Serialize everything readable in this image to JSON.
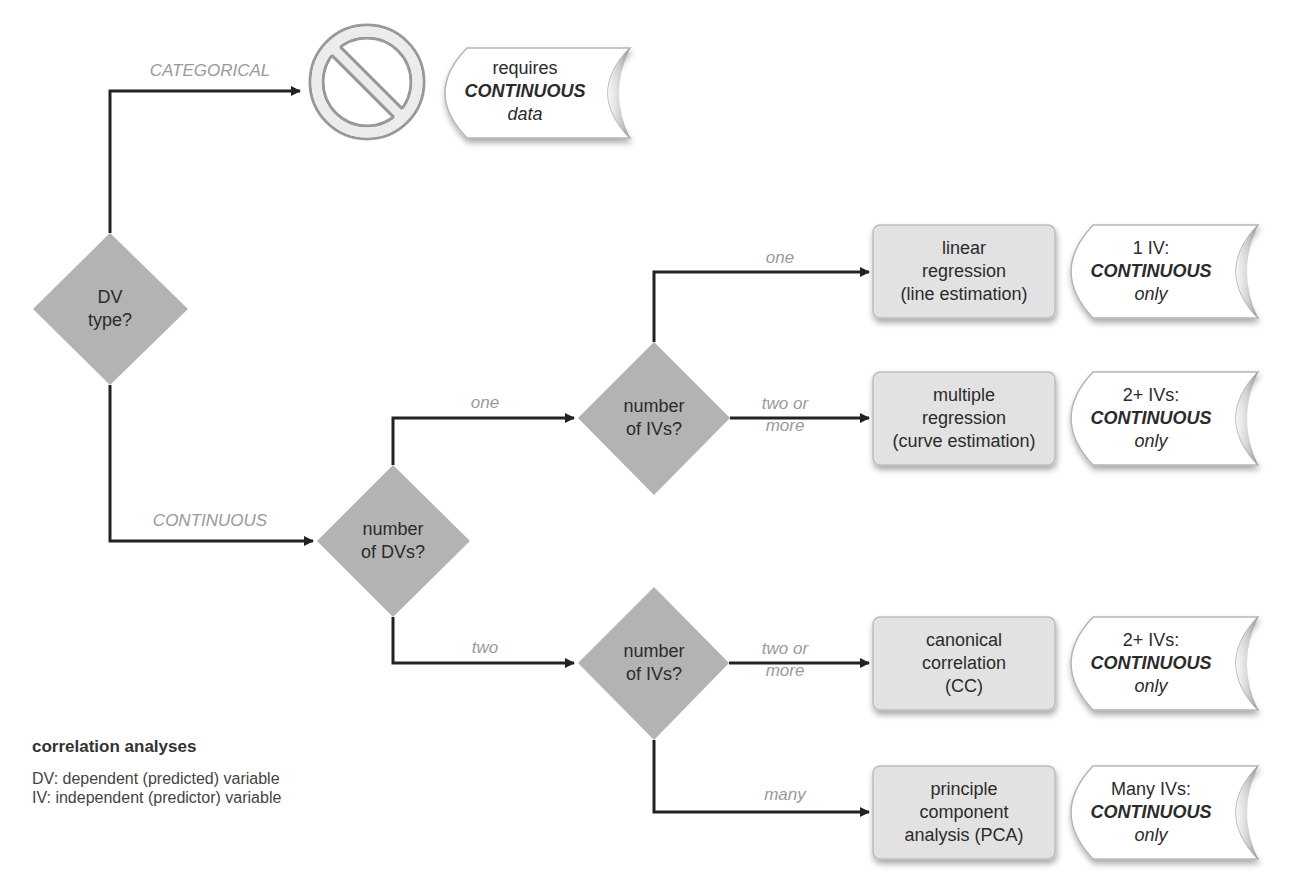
{
  "title": "correlation analyses",
  "legend": {
    "title": "correlation analyses",
    "lines": [
      "DV: dependent (predicted) variable",
      "IV: independent (predictor) variable"
    ]
  },
  "colors": {
    "diamond_fill": "#b3b3b3",
    "box_fill": "#e2e2e2",
    "box_border": "#bdbdbd",
    "arrow": "#222222",
    "branch_label": "#9a9a9a",
    "prohibit_stroke": "#999999"
  },
  "decisions": {
    "dv_type": {
      "lines": [
        "DV",
        "type?"
      ]
    },
    "num_dvs": {
      "lines": [
        "number",
        "of DVs?"
      ]
    },
    "num_ivs_one": {
      "lines": [
        "number",
        "of IVs?"
      ]
    },
    "num_ivs_two": {
      "lines": [
        "number",
        "of IVs?"
      ]
    }
  },
  "branches": {
    "categorical": "CATEGORICAL",
    "continuous": "CONTINUOUS",
    "dvs_one": "one",
    "dvs_two": "two",
    "ivs_one": "one",
    "ivs_two_or_more_a": [
      "two or",
      "more"
    ],
    "ivs_two_or_more_b": [
      "two or",
      "more"
    ],
    "ivs_many": "many"
  },
  "blocked": {
    "icon": "prohibited-icon",
    "note": {
      "line1": "requires",
      "line2": "CONTINUOUS",
      "line3": "data"
    }
  },
  "outcomes": [
    {
      "id": "linear-regression",
      "lines": [
        "linear",
        "regression",
        "(line estimation)"
      ],
      "note": {
        "line1": "1 IV:",
        "line2": "CONTINUOUS",
        "line3": "only"
      }
    },
    {
      "id": "multiple-regression",
      "lines": [
        "multiple",
        "regression",
        "(curve estimation)"
      ],
      "note": {
        "line1": "2+ IVs:",
        "line2": "CONTINUOUS",
        "line3": "only"
      }
    },
    {
      "id": "canonical-correlation",
      "lines": [
        "canonical",
        "correlation",
        "(CC)"
      ],
      "note": {
        "line1": "2+ IVs:",
        "line2": "CONTINUOUS",
        "line3": "only"
      }
    },
    {
      "id": "pca",
      "lines": [
        "principle",
        "component",
        "analysis (PCA)"
      ],
      "note": {
        "line1": "Many IVs:",
        "line2": "CONTINUOUS",
        "line3": "only"
      }
    }
  ]
}
